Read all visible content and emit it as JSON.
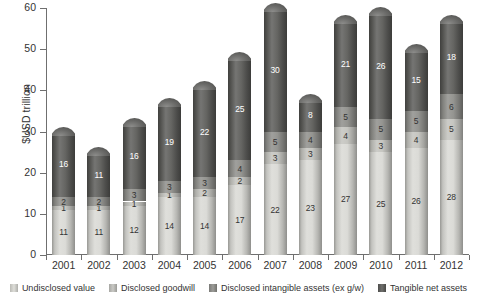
{
  "chart_data": {
    "type": "bar",
    "subtype": "stacked-bar-cylinder",
    "title": "",
    "subtitle": "",
    "xlabel": "",
    "ylabel": "$USD trillion",
    "ylim": [
      0,
      60
    ],
    "yticks": [
      0,
      10,
      20,
      30,
      40,
      50,
      60
    ],
    "ytick_labels": [
      "0",
      "10",
      "20",
      "30",
      "40",
      "50",
      "60"
    ],
    "grid": false,
    "legend_position": "bottom",
    "categories": [
      "2001",
      "2002",
      "2003",
      "2004",
      "2005",
      "2006",
      "2007",
      "2008",
      "2009",
      "2010",
      "2011",
      "2012"
    ],
    "series": [
      {
        "name": "Undisclosed value",
        "color": "#d9d9d4",
        "label_color": "#333333",
        "values": [
          11,
          11,
          12,
          14,
          14,
          17,
          22,
          23,
          27,
          25,
          26,
          28
        ]
      },
      {
        "name": "Disclosed goodwill",
        "color": "#c2c2bd",
        "label_color": "#333333",
        "values": [
          1,
          1,
          1,
          1,
          2,
          2,
          3,
          3,
          4,
          3,
          4,
          5
        ]
      },
      {
        "name": "Disclosed intangible assets (ex g/w)",
        "color": "#8e8e8a",
        "label_color": "#333333",
        "values": [
          2,
          2,
          3,
          3,
          3,
          4,
          5,
          4,
          5,
          5,
          5,
          6
        ]
      },
      {
        "name": "Tangible net assets",
        "color": "#5b5b58",
        "label_color": "#ffffff",
        "values": [
          16,
          11,
          16,
          19,
          22,
          25,
          30,
          8,
          21,
          26,
          15,
          18
        ]
      }
    ],
    "totals": [
      30,
      25,
      32,
      37,
      41,
      48,
      60,
      38,
      57,
      59,
      50,
      57
    ]
  },
  "legend": {
    "items": [
      {
        "label": "Undisclosed value",
        "color": "#d9d9d4"
      },
      {
        "label": "Disclosed goodwill",
        "color": "#c2c2bd"
      },
      {
        "label": "Disclosed intangible assets (ex g/w)",
        "color": "#8e8e8a"
      },
      {
        "label": "Tangible net assets",
        "color": "#5b5b58"
      }
    ]
  },
  "axes": {
    "y_title": "$USD trillion"
  }
}
